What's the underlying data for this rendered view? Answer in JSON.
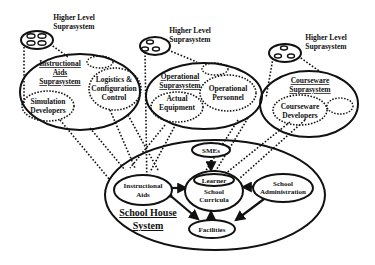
{
  "diagram": {
    "type": "systems-hierarchy",
    "higher_level": [
      {
        "id": "hl-left",
        "line1": "Higher Level",
        "line2": "Suprasystem"
      },
      {
        "id": "hl-mid",
        "line1": "Higher Level",
        "line2": "Suprasystem"
      },
      {
        "id": "hl-right",
        "line1": "Higher Level",
        "line2": "Suprasystem"
      }
    ],
    "suprasystems": [
      {
        "id": "instructional-aids",
        "title": [
          "Instructional",
          "Aids",
          "Suprasystem"
        ],
        "members": [
          {
            "label": [
              "Logistics &",
              "Configuration",
              "Control"
            ]
          },
          {
            "label": [
              "Simulation",
              "Developers"
            ]
          }
        ]
      },
      {
        "id": "operational",
        "title": [
          "Operational",
          "Suprasystem"
        ],
        "members": [
          {
            "label": [
              "Actual",
              "Equipment"
            ]
          },
          {
            "label": [
              "Operational",
              "Personnel"
            ]
          }
        ]
      },
      {
        "id": "courseware",
        "title": [
          "Courseware",
          "Suprasystem"
        ],
        "members": [
          {
            "label": [
              "Courseware",
              "Developers"
            ]
          }
        ]
      }
    ],
    "school_house": {
      "title": [
        "School House",
        "System"
      ],
      "nodes": {
        "smes": "SMEs",
        "learner": "Learner",
        "curricula": [
          "School",
          "Curricula"
        ],
        "instructional_aids": [
          "Instructional",
          "Aids"
        ],
        "administration": [
          "School",
          "Administration"
        ],
        "facilities": "Facilities"
      }
    },
    "colors": {
      "stroke": "#111111",
      "background": "#ffffff"
    }
  }
}
